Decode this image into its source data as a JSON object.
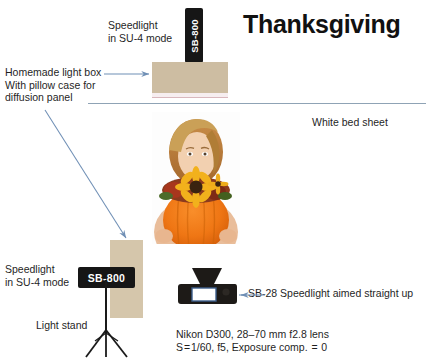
{
  "title": "Thanksgiving",
  "annotations": {
    "speedlight_top": "Speedlight\nin SU-4 mode",
    "lightbox": "Homemade light box\nWith pillow case for\ndiffusion panel",
    "bed_sheet": "White bed sheet",
    "speedlight_bottom": "Speedlight\nin SU-4 mode",
    "light_stand": "Light stand",
    "sb28": "SB-28 Speedlight aimed straight up",
    "camera_settings": "Nikon D300, 28–70 mm f2.8 lens\nS = 1/60, f5, Exposure comp.  =  0"
  },
  "devices": {
    "flash_top_label": "SB-800",
    "flash_bottom_label": "SB-800"
  },
  "colors": {
    "lightbox_tan": "#cdbda2",
    "lightbox_tan_bottom": "#d5c6ab",
    "flash_black": "#161616",
    "arrow_blue": "#6f8fb5",
    "sheet_line": "#8fa3b5",
    "stand_black": "#1a1a1a",
    "diffusion_pink": "#f6eef0",
    "title_black": "#111111"
  },
  "photo": {
    "alt": "woman holding a pumpkin decorated with autumn sunflowers"
  }
}
